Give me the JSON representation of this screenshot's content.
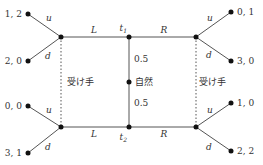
{
  "diagram": {
    "type": "extensive-form game tree",
    "nature": {
      "label": "自然",
      "prob_top": "0.5",
      "prob_bottom": "0.5"
    },
    "sender_nodes": {
      "top": "t1",
      "bottom": "t2",
      "top_main": "t",
      "top_sub": "1",
      "bottom_main": "t",
      "bottom_sub": "2"
    },
    "actions": {
      "left": "L",
      "right": "R",
      "up": "u",
      "down": "d"
    },
    "information_sets": {
      "left": "受け手",
      "right": "受け手"
    },
    "payoffs": {
      "top_left_u": "1, 2",
      "top_left_d": "2, 0",
      "top_right_u": "0, 1",
      "top_right_d": "3, 0",
      "bottom_left_u": "0, 0",
      "bottom_left_d": "3, 1",
      "bottom_right_u": "1, 0",
      "bottom_right_d": "2, 2"
    }
  }
}
